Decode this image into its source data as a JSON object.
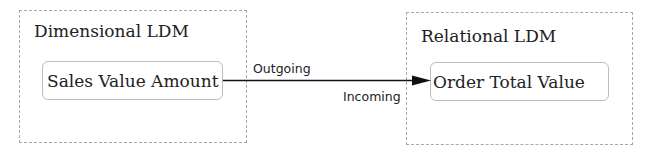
{
  "groups": [
    {
      "id": "dimensional",
      "title": "Dimensional LDM"
    },
    {
      "id": "relational",
      "title": "Relational LDM"
    }
  ],
  "nodes": {
    "source": {
      "label": "Sales Value Amount"
    },
    "target": {
      "label": "Order Total Value"
    }
  },
  "edge": {
    "outgoing_label": "Outgoing",
    "incoming_label": "Incoming"
  }
}
